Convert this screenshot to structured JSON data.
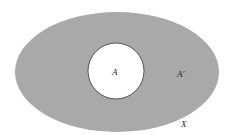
{
  "diagram": {
    "type": "venn",
    "universe": {
      "label": "X",
      "fill": "#a9a9a9"
    },
    "set": {
      "label": "A",
      "fill": "#ffffff",
      "stroke": "#333333"
    },
    "complement": {
      "label": "A′"
    }
  }
}
